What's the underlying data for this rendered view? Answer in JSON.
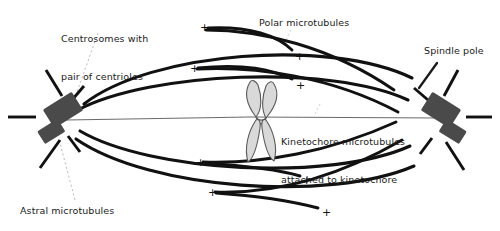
{
  "figure": {
    "background_color": "#ffffff"
  },
  "colors": {
    "microtubule": "#111111",
    "centrosome": "#4a4a4a",
    "chromosome_fill": "#d9d9d9",
    "chromosome_stroke": "#5a5a5a",
    "axis_line": "#6b6b6b",
    "leader_line": "#b0b0b0",
    "text": "#1b1b1b"
  },
  "labels": {
    "centrosomes": {
      "line1": "Centrosomes with",
      "line2": "pair of centrioles"
    },
    "polar": "Polar microtubules",
    "spindle_pole": "Spindle pole",
    "kinetochore": {
      "line1": "Kinetochore microtubules",
      "line2": "attached to kinetochore"
    },
    "astral": "Astral microtubules"
  },
  "plus_ends": [
    {
      "id": "plus-upper-left-1",
      "symbol": "+",
      "x": 200,
      "y": 22
    },
    {
      "id": "plus-upper-right-1",
      "symbol": "+",
      "x": 295,
      "y": 51
    },
    {
      "id": "plus-upper-left-2",
      "symbol": "+",
      "x": 190,
      "y": 63
    },
    {
      "id": "plus-upper-right-2",
      "symbol": "+",
      "x": 296,
      "y": 80
    },
    {
      "id": "plus-lower-left-1",
      "symbol": "+",
      "x": 196,
      "y": 157
    },
    {
      "id": "plus-lower-right-1",
      "symbol": "+",
      "x": 302,
      "y": 175
    },
    {
      "id": "plus-lower-left-2",
      "symbol": "+",
      "x": 208,
      "y": 187
    },
    {
      "id": "plus-lower-right-2",
      "symbol": "+",
      "x": 322,
      "y": 207
    }
  ],
  "structures": {
    "left_pole": {
      "cx": 62,
      "cy": 117
    },
    "right_pole": {
      "cx": 443,
      "cy": 117
    },
    "chromosome": {
      "cx": 263,
      "cy": 122
    },
    "astral_ray_count_per_pole": 5,
    "polar_microtubule_arcs": 4,
    "kinetochore_microtubule_arcs": 8
  }
}
